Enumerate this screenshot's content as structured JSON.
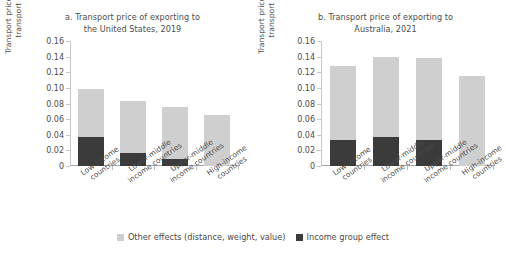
{
  "legend": {
    "items": [
      {
        "label": "Other effects (distance, weight, value)",
        "color": "#cfcfcf"
      },
      {
        "label": "Income group effect",
        "color": "#3b3b3b"
      }
    ]
  },
  "panels": [
    {
      "title_line1": "a. Transport price of exporting to",
      "title_line2": "the United States, 2019",
      "ylabel_line1": "Transport price per dollar of",
      "ylabel_line2": "transport goods ($)"
    },
    {
      "title_line1": "b. Transport price of exporting to",
      "title_line2": "Australia, 2021",
      "ylabel_line1": "Transport price per dollar of",
      "ylabel_line2": "transport goods ($)"
    }
  ],
  "axis": {
    "ticks": [
      "0.16",
      "0.14",
      "0.12",
      "0.10",
      "0.08",
      "0.06",
      "0.04",
      "0.02",
      "0"
    ]
  },
  "categories": [
    {
      "line1": "Low-income",
      "line2": "countries"
    },
    {
      "line1": "Lower-middle",
      "line2": "income countries"
    },
    {
      "line1": "Upper-middle",
      "line2": "income countries"
    },
    {
      "line1": "High-income",
      "line2": "countries"
    }
  ],
  "chart_data": [
    {
      "type": "bar",
      "stacked": true,
      "title": "a. Transport price of exporting to the United States, 2019",
      "xlabel": "",
      "ylabel": "Transport price per dollar of transport goods ($)",
      "ylim": [
        0,
        0.16
      ],
      "ytick_step": 0.02,
      "grid": false,
      "legend_position": "bottom-center",
      "categories": [
        "Low-income countries",
        "Lower-middle income countries",
        "Upper-middle income countries",
        "High-income countries"
      ],
      "series": [
        {
          "name": "Income group effect",
          "color": "#3b3b3b",
          "values": [
            0.037,
            0.017,
            0.009,
            0.0
          ]
        },
        {
          "name": "Other effects (distance, weight, value)",
          "color": "#cfcfcf",
          "values": [
            0.062,
            0.066,
            0.066,
            0.065
          ]
        }
      ],
      "totals": [
        0.099,
        0.083,
        0.075,
        0.065
      ]
    },
    {
      "type": "bar",
      "stacked": true,
      "title": "b. Transport price of exporting to Australia, 2021",
      "xlabel": "",
      "ylabel": "Transport price per dollar of transport goods ($)",
      "ylim": [
        0,
        0.16
      ],
      "ytick_step": 0.02,
      "grid": false,
      "legend_position": "bottom-center",
      "categories": [
        "Low-income countries",
        "Lower-middle income countries",
        "Upper-middle income countries",
        "High-income countries"
      ],
      "series": [
        {
          "name": "Income group effect",
          "color": "#3b3b3b",
          "values": [
            0.033,
            0.037,
            0.033,
            0.0
          ]
        },
        {
          "name": "Other effects (distance, weight, value)",
          "color": "#cfcfcf",
          "values": [
            0.095,
            0.102,
            0.105,
            0.115
          ]
        }
      ],
      "totals": [
        0.128,
        0.139,
        0.138,
        0.115
      ]
    }
  ]
}
